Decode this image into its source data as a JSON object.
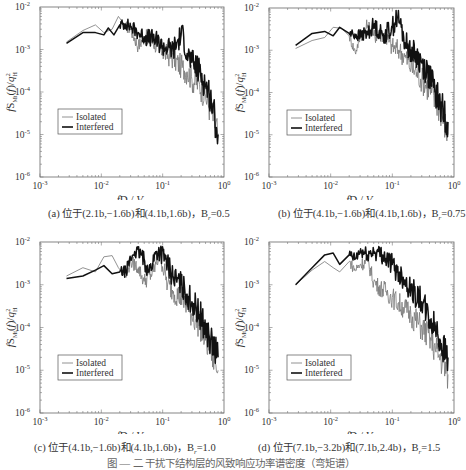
{
  "figure": {
    "caption": "图 — 二 干扰下结构层的风致响应功率谱密度（弯矩谱）"
  },
  "panels": [
    {
      "id": "a",
      "caption": "(a) 位于(2.1b, −1.6b)和(4.1b, 1.6b)，B_r=0.5",
      "caption_main": "(a) 位于(2.1",
      "caption_full": "(a) 位于(2.1b,−1.6b)和(4.1b,1.6b)，B",
      "caption_sub": "r",
      "caption_val": "=0.5"
    },
    {
      "id": "b",
      "caption_full": "(b) 位于(4.1b,−1.6b)和(4.1b,1.6b)，B",
      "caption_sub": "r",
      "caption_val": "=0.75"
    },
    {
      "id": "c",
      "caption_full": "(c) 位于(4.1b,−1.6b)和(4.1b,1.6b)，B",
      "caption_sub": "r",
      "caption_val": "=1.0"
    },
    {
      "id": "d",
      "caption_full": "(d) 位于(7.1b,−3.2b)和(7.1b,2.4b)，B",
      "caption_sub": "r",
      "caption_val": "=1.5"
    }
  ],
  "axes": {
    "xlabel": "fD / V_H",
    "ylabel": "f S_Mt(f) / q_H^2",
    "xticks": [
      "10^-3",
      "10^-2",
      "10^-1",
      "10^0"
    ],
    "yticks": [
      "10^-6",
      "10^-5",
      "10^-4",
      "10^-3",
      "10^-2"
    ]
  },
  "legend": {
    "isolated": "Isolated",
    "interfered": "Interfered"
  },
  "chart_data": [
    {
      "type": "line",
      "title": "(a) 位于(2.1b,−1.6b)和(4.1b,1.6b)，Br=0.5",
      "xlabel": "fD/V_H",
      "ylabel": "fS_Mt(f)/q_H^2",
      "xscale": "log",
      "yscale": "log",
      "xlim": [
        0.001,
        1
      ],
      "ylim": [
        1e-06,
        0.01
      ],
      "legend_position": "center-left",
      "series": [
        {
          "name": "Isolated",
          "x": [
            0.0027,
            0.005,
            0.008,
            0.011,
            0.015,
            0.019,
            0.025,
            0.03,
            0.04,
            0.05,
            0.07,
            0.1,
            0.15,
            0.2,
            0.25,
            0.3,
            0.4,
            0.5,
            0.6,
            0.8
          ],
          "y": [
            0.0015,
            0.0028,
            0.0038,
            0.0025,
            0.003,
            0.006,
            0.0035,
            0.003,
            0.0012,
            0.002,
            0.0015,
            0.0009,
            0.0006,
            0.0004,
            0.0003,
            0.0002,
            0.00015,
            8e-05,
            4e-05,
            1e-05
          ]
        },
        {
          "name": "Interfered",
          "x": [
            0.0027,
            0.005,
            0.008,
            0.011,
            0.013,
            0.016,
            0.02,
            0.025,
            0.03,
            0.04,
            0.05,
            0.07,
            0.1,
            0.15,
            0.2,
            0.22,
            0.25,
            0.3,
            0.4,
            0.5,
            0.6,
            0.8
          ],
          "y": [
            0.0014,
            0.0025,
            0.0025,
            0.0022,
            0.0032,
            0.0022,
            0.0038,
            0.004,
            0.0035,
            0.0025,
            0.002,
            0.0018,
            0.0012,
            0.001,
            0.0022,
            0.002,
            0.0008,
            0.0005,
            0.0003,
            0.00015,
            8e-05,
            1e-05
          ]
        }
      ]
    },
    {
      "type": "line",
      "title": "(b) 位于(4.1b,−1.6b)和(4.1b,1.6b)，Br=0.75",
      "xlabel": "fD/V_H",
      "ylabel": "fS_Mt(f)/q_H^2",
      "xscale": "log",
      "yscale": "log",
      "xlim": [
        0.001,
        1
      ],
      "ylim": [
        1e-06,
        0.01
      ],
      "legend_position": "center-left",
      "series": [
        {
          "name": "Isolated",
          "x": [
            0.0027,
            0.005,
            0.008,
            0.011,
            0.015,
            0.02,
            0.025,
            0.03,
            0.04,
            0.05,
            0.07,
            0.1,
            0.13,
            0.16,
            0.2,
            0.25,
            0.3,
            0.4,
            0.5,
            0.6,
            0.8
          ],
          "y": [
            0.0011,
            0.0017,
            0.002,
            0.0035,
            0.0033,
            0.0022,
            0.0009,
            0.002,
            0.004,
            0.0022,
            0.0025,
            0.0012,
            0.001,
            0.0007,
            0.0004,
            0.0003,
            0.0002,
            0.00012,
            6e-05,
            4e-05,
            1e-05
          ]
        },
        {
          "name": "Interfered",
          "x": [
            0.0027,
            0.005,
            0.008,
            0.011,
            0.014,
            0.02,
            0.03,
            0.04,
            0.05,
            0.07,
            0.1,
            0.12,
            0.14,
            0.16,
            0.2,
            0.25,
            0.3,
            0.4,
            0.5,
            0.6,
            0.8
          ],
          "y": [
            0.0013,
            0.0025,
            0.0028,
            0.0022,
            0.0035,
            0.0025,
            0.0022,
            0.0025,
            0.004,
            0.0022,
            0.0035,
            0.006,
            0.0035,
            0.0015,
            0.001,
            0.0007,
            0.0005,
            0.00025,
            0.0001,
            5e-05,
            2e-05
          ]
        }
      ]
    },
    {
      "type": "line",
      "title": "(c) 位于(4.1b,−1.6b)和(4.1b,1.6b)，Br=1.0",
      "xlabel": "fD/V_H",
      "ylabel": "fS_Mt(f)/q_H^2",
      "xscale": "log",
      "yscale": "log",
      "xlim": [
        0.001,
        1
      ],
      "ylim": [
        1e-06,
        0.01
      ],
      "legend_position": "lower-left",
      "series": [
        {
          "name": "Isolated",
          "x": [
            0.0027,
            0.005,
            0.008,
            0.011,
            0.015,
            0.019,
            0.025,
            0.03,
            0.04,
            0.05,
            0.07,
            0.09,
            0.12,
            0.15,
            0.2,
            0.25,
            0.3,
            0.4,
            0.5,
            0.6,
            0.8
          ],
          "y": [
            0.0016,
            0.0025,
            0.002,
            0.0045,
            0.0048,
            0.0025,
            0.0015,
            0.0035,
            0.0025,
            0.0012,
            0.002,
            0.0055,
            0.001,
            0.0007,
            0.0005,
            0.0003,
            0.0002,
            0.00012,
            5e-05,
            3e-05,
            1e-05
          ]
        },
        {
          "name": "Interfered",
          "x": [
            0.0027,
            0.005,
            0.008,
            0.011,
            0.015,
            0.02,
            0.025,
            0.03,
            0.035,
            0.045,
            0.06,
            0.08,
            0.09,
            0.11,
            0.15,
            0.2,
            0.25,
            0.3,
            0.4,
            0.5,
            0.6,
            0.8
          ],
          "y": [
            0.0014,
            0.0016,
            0.0022,
            0.0028,
            0.0018,
            0.002,
            0.002,
            0.004,
            0.006,
            0.005,
            0.002,
            0.006,
            0.006,
            0.004,
            0.0015,
            0.001,
            0.0006,
            0.0004,
            0.0002,
            0.0001,
            5e-05,
            2e-05
          ]
        }
      ]
    },
    {
      "type": "line",
      "title": "(d) 位于(7.1b,−3.2b)和(7.1b,2.4b)，Br=1.5",
      "xlabel": "fD/V_H",
      "ylabel": "fS_Mt(f)/q_H^2",
      "xscale": "log",
      "yscale": "log",
      "xlim": [
        0.001,
        1
      ],
      "ylim": [
        1e-06,
        0.01
      ],
      "legend_position": "lower-left",
      "series": [
        {
          "name": "Isolated",
          "x": [
            0.0027,
            0.005,
            0.008,
            0.011,
            0.014,
            0.02,
            0.025,
            0.03,
            0.04,
            0.05,
            0.06,
            0.08,
            0.1,
            0.15,
            0.2,
            0.3,
            0.4,
            0.5,
            0.6,
            0.8
          ],
          "y": [
            0.001,
            0.0022,
            0.0035,
            0.0025,
            0.002,
            0.0035,
            0.0022,
            0.003,
            0.0035,
            0.0012,
            0.0009,
            0.0007,
            0.0005,
            0.0003,
            0.0002,
            0.0001,
            6e-05,
            3e-05,
            2e-05,
            8e-06
          ]
        },
        {
          "name": "Interfered",
          "x": [
            0.0027,
            0.005,
            0.008,
            0.011,
            0.014,
            0.02,
            0.025,
            0.03,
            0.04,
            0.05,
            0.07,
            0.1,
            0.12,
            0.15,
            0.2,
            0.3,
            0.4,
            0.5,
            0.6,
            0.8
          ],
          "y": [
            0.001,
            0.0025,
            0.005,
            0.0055,
            0.003,
            0.005,
            0.004,
            0.006,
            0.005,
            0.006,
            0.005,
            0.003,
            0.002,
            0.0015,
            0.0008,
            0.0004,
            0.00015,
            0.0001,
            5e-05,
            2e-05
          ]
        }
      ]
    }
  ]
}
